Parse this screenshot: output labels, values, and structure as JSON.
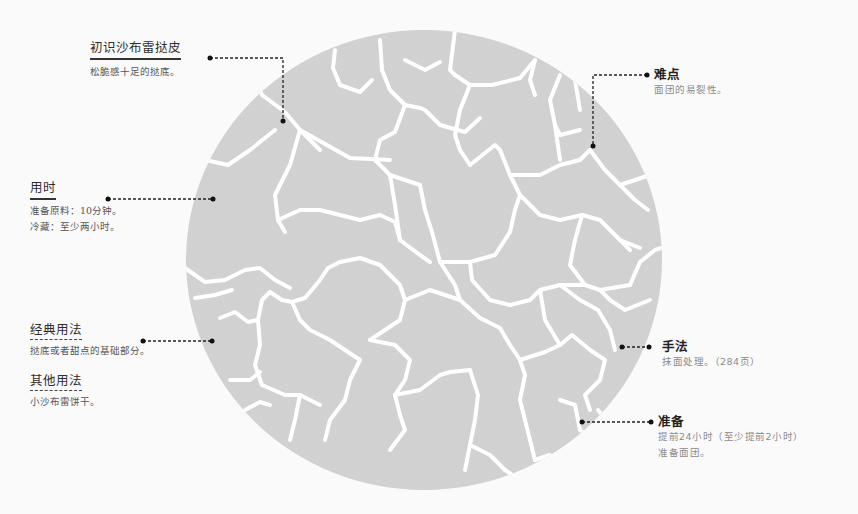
{
  "colors": {
    "background": "#fafafa",
    "circle_fill": "#d5d5d5",
    "crack": "#ffffff",
    "leader": "#222222",
    "heading": "#2e2e2e",
    "body_text": "#555555",
    "muted_text": "#8a8a8a"
  },
  "illustration": {
    "description": "cracked-dough-disc",
    "shape": "circle"
  },
  "left_labels": [
    {
      "title": "初识沙布雷挞皮",
      "underline": "solid",
      "lines": [
        "松脆感十足的挞底。"
      ]
    },
    {
      "title": "用时",
      "underline": "solid",
      "lines": [
        "准备原料：10分钟。",
        "冷藏：至少两小时。"
      ]
    },
    {
      "title": "经典用法",
      "underline": "dashed",
      "lines": [
        "挞底或者甜点的基础部分。"
      ]
    },
    {
      "title": "其他用法",
      "underline": "dashed",
      "lines": [
        "小沙布雷饼干。"
      ]
    }
  ],
  "right_labels": [
    {
      "title": "难点",
      "lines": [
        "面团的易裂性。"
      ]
    },
    {
      "title": "手法",
      "lines": [
        "抹面处理。（284页）"
      ]
    },
    {
      "title": "准备",
      "lines": [
        "提前24小时（至少提前2小时）",
        "准备面团。"
      ]
    }
  ]
}
